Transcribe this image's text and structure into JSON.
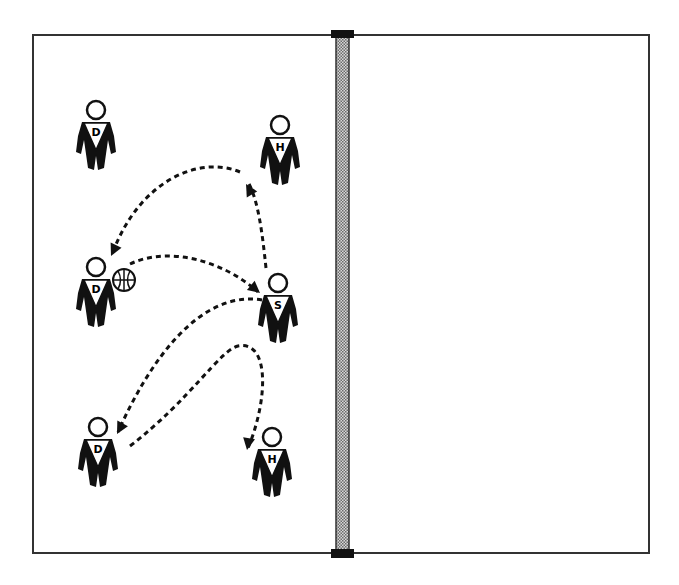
{
  "diagram": {
    "type": "volleyball-drill",
    "court": {
      "x": 33,
      "y": 35,
      "width": 616,
      "height": 518,
      "stroke": "#333333"
    },
    "net": {
      "x": 336,
      "y": 35,
      "width": 13,
      "height": 518,
      "fill": "#bdbdbd",
      "post_color": "#111111"
    },
    "players": [
      {
        "id": "d1",
        "label": "D",
        "x": 96,
        "y": 110
      },
      {
        "id": "h1",
        "label": "H",
        "x": 280,
        "y": 125
      },
      {
        "id": "d2",
        "label": "D",
        "x": 96,
        "y": 267
      },
      {
        "id": "s",
        "label": "S",
        "x": 278,
        "y": 283
      },
      {
        "id": "d3",
        "label": "D",
        "x": 98,
        "y": 427
      },
      {
        "id": "h2",
        "label": "H",
        "x": 272,
        "y": 437
      }
    ],
    "ball": {
      "x": 124,
      "y": 280,
      "r": 11
    },
    "paths": [
      {
        "id": "s-to-h1",
        "d": "M266 268 C 262 230, 258 200, 248 182"
      },
      {
        "id": "h1-to-d2",
        "d": "M240 172 C 200 155, 140 180, 113 252"
      },
      {
        "id": "ball-to-s",
        "d": "M130 264 C 170 245, 225 262, 258 292"
      },
      {
        "id": "s-to-d3",
        "d": "M262 300 C 200 290, 150 360, 118 432"
      },
      {
        "id": "d3-to-h2",
        "d": "M130 446 C 190 400, 220 350, 238 346 C 270 340, 268 400, 248 448"
      }
    ],
    "arrowheads": [
      {
        "id": "arrow-h1",
        "x": 246,
        "y": 184,
        "angle": 240
      },
      {
        "id": "arrow-d2",
        "x": 111,
        "y": 256,
        "angle": 115
      },
      {
        "id": "arrow-s",
        "x": 260,
        "y": 293,
        "angle": 40
      },
      {
        "id": "arrow-d3",
        "x": 117,
        "y": 434,
        "angle": 118
      },
      {
        "id": "arrow-h2",
        "x": 247,
        "y": 450,
        "angle": 100
      }
    ],
    "colors": {
      "line": "#111111",
      "figure": "#111111",
      "background": "#ffffff"
    }
  }
}
